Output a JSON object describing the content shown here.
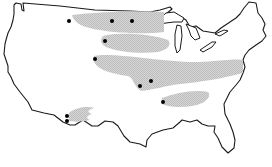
{
  "map": {
    "subject": "Contiguous United States outline",
    "style": "black line outline on white, stippled gray shaded bands, black point markers",
    "colors": {
      "background": "#ffffff",
      "outline": "#1a1a1a",
      "band_fill": "#c8c8c8",
      "marker": "#000000"
    },
    "bands": [
      {
        "id": "band-north",
        "label": "northern band"
      },
      {
        "id": "band-upper-midwest",
        "label": "upper midwest band"
      },
      {
        "id": "band-central",
        "label": "central band"
      },
      {
        "id": "band-south-central",
        "label": "south-central band"
      },
      {
        "id": "band-southwest",
        "label": "southwest band"
      }
    ],
    "markers": [
      {
        "id": "m1",
        "x": 69,
        "y": 21
      },
      {
        "id": "m2",
        "x": 112,
        "y": 21
      },
      {
        "id": "m3",
        "x": 132,
        "y": 21
      },
      {
        "id": "m4",
        "x": 105,
        "y": 41
      },
      {
        "id": "m5",
        "x": 95,
        "y": 59
      },
      {
        "id": "m6",
        "x": 151,
        "y": 81
      },
      {
        "id": "m7",
        "x": 140,
        "y": 86
      },
      {
        "id": "m8",
        "x": 163,
        "y": 102
      },
      {
        "id": "m9",
        "x": 67,
        "y": 116
      },
      {
        "id": "m10",
        "x": 67,
        "y": 121
      }
    ]
  }
}
